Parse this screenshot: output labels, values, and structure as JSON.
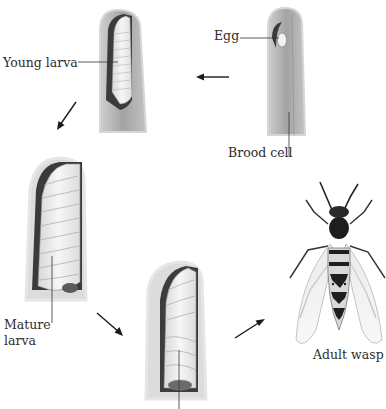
{
  "diagram": {
    "stages": [
      {
        "id": "egg",
        "label": "Egg"
      },
      {
        "id": "brood-cell",
        "label": "Brood cell"
      },
      {
        "id": "young-larva",
        "label": "Young larva"
      },
      {
        "id": "mature-larva",
        "label_line1": "Mature",
        "label_line2": "larva"
      },
      {
        "id": "pupa",
        "label": ""
      },
      {
        "id": "adult-wasp",
        "label": "Adult wasp"
      }
    ],
    "colors": {
      "cell_wall": "#b9b9b9",
      "cell_inner": "#9c9c9c",
      "cell_shadow": "#3a3a3a",
      "larva": "#ececec",
      "arrow": "#1a1a1a",
      "wasp_dark": "#1e1e1e",
      "wasp_light": "#d9d9d9"
    }
  }
}
